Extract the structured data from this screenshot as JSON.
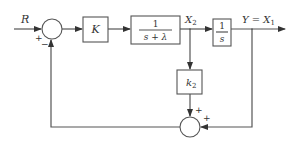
{
  "diagram": {
    "type": "block-diagram",
    "input": {
      "label": "R"
    },
    "output": {
      "label": "Y = X",
      "subscript": "1"
    },
    "junctions": [
      {
        "id": "sum1",
        "signs": {
          "left": "+",
          "bottom": "−"
        }
      },
      {
        "id": "sum2",
        "signs": {
          "top": "+",
          "right": "+"
        }
      }
    ],
    "blocks": {
      "gain": {
        "label": "K"
      },
      "plant1": {
        "numerator": "1",
        "denominator": "s + λ"
      },
      "integrator": {
        "numerator": "1",
        "denominator": "s"
      },
      "feedback_gain": {
        "label": "k",
        "subscript": "2"
      }
    },
    "signals": {
      "x2": {
        "label": "X",
        "subscript": "2"
      }
    },
    "colors": {
      "line": "#555555",
      "text": "#333333",
      "background": "#ffffff"
    }
  }
}
